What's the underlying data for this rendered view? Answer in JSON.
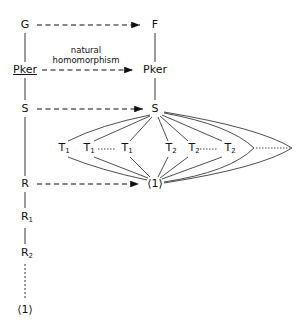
{
  "left_column": {
    "G": "G",
    "Pker": "Pker",
    "S": "S",
    "R": "R",
    "R1": "R",
    "R1_sub": "1",
    "R2": "R",
    "R2_sub": "2",
    "trivial": "⟨1⟩"
  },
  "right_column": {
    "F": "F",
    "Pker": "Pker",
    "S": "S",
    "trivial": "⟨1⟩"
  },
  "middle": {
    "T1_label": "T",
    "T1_sub": "1",
    "T2_label": "T",
    "T2_sub": "2",
    "T1_copies": 3,
    "T2_copies": 3
  },
  "arrow_label": {
    "line1": "natural",
    "line2": "homomorphism"
  }
}
